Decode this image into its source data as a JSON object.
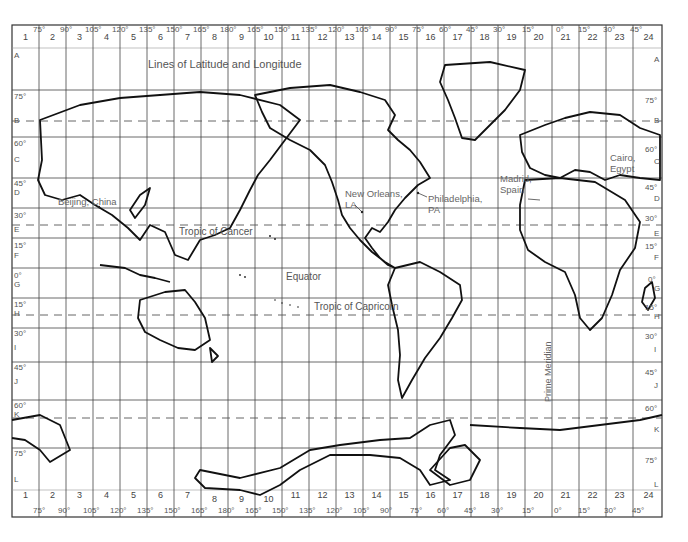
{
  "title": "Lines of Latitude and Longitude",
  "columns": {
    "numbers": [
      "1",
      "2",
      "3",
      "4",
      "5",
      "6",
      "7",
      "8",
      "9",
      "10",
      "11",
      "12",
      "13",
      "14",
      "15",
      "16",
      "17",
      "18",
      "19",
      "20",
      "21",
      "22",
      "23",
      "24"
    ],
    "top_longitudes": [
      "75°",
      "90°",
      "105°",
      "120°",
      "135°",
      "150°",
      "165°",
      "180°",
      "165°",
      "150°",
      "135°",
      "120°",
      "105°",
      "90°",
      "75°",
      "60°",
      "45°",
      "30°",
      "15°",
      "0°",
      "15°",
      "30°",
      "45°"
    ],
    "bottom_longitudes": [
      "75°",
      "90°",
      "105°",
      "120°",
      "135°",
      "150°",
      "165°",
      "180°",
      "165°",
      "150°",
      "135°",
      "120°",
      "105°",
      "90°",
      "75°",
      "60°",
      "45°",
      "30°",
      "15°",
      "0°",
      "15°",
      "30°",
      "45°"
    ]
  },
  "rows": {
    "letters": [
      "A",
      "B",
      "C",
      "D",
      "E",
      "F",
      "G",
      "H",
      "I",
      "J",
      "K",
      "L"
    ],
    "latitudes": [
      "75°",
      "60°",
      "45°",
      "30°",
      "15°",
      "0°",
      "15°",
      "30°",
      "45°",
      "60°",
      "75°"
    ]
  },
  "special_lines": {
    "tropic_of_cancer": "Tropic of Cancer",
    "equator": "Equator",
    "tropic_of_capricorn": "Tropic of Capricorn",
    "prime_meridian": "Prime Meridian"
  },
  "places": {
    "beijing": "Beijing, China",
    "new_orleans": "New Orleans,\nLA",
    "philadelphia": "Philadelphia,\nPA",
    "madrid": "Madrid,\nSpain",
    "cairo": "Cairo,\nEgypt"
  }
}
